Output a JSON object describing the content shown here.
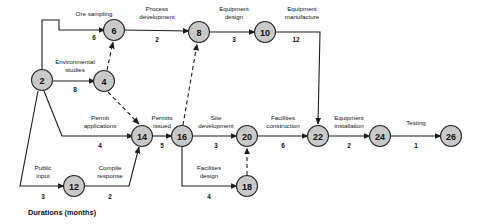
{
  "diagram": {
    "caption": "Durations (months)",
    "node_fill": "#c9c9c9",
    "node_stroke": "#2b2b2b",
    "line_color": "#1c1c1c",
    "nodes": [
      {
        "id": "n2",
        "label": "2",
        "cx": 42,
        "cy": 80
      },
      {
        "id": "n4",
        "label": "4",
        "cx": 104,
        "cy": 81
      },
      {
        "id": "n6",
        "label": "6",
        "cx": 114,
        "cy": 30
      },
      {
        "id": "n8",
        "label": "8",
        "cx": 199,
        "cy": 32
      },
      {
        "id": "n10",
        "label": "10",
        "cx": 265,
        "cy": 32
      },
      {
        "id": "n12",
        "label": "12",
        "cx": 74,
        "cy": 186
      },
      {
        "id": "n14",
        "label": "14",
        "cx": 142,
        "cy": 136
      },
      {
        "id": "n16",
        "label": "16",
        "cx": 182,
        "cy": 136
      },
      {
        "id": "n18",
        "label": "18",
        "cx": 247,
        "cy": 186
      },
      {
        "id": "n20",
        "label": "20",
        "cx": 247,
        "cy": 136
      },
      {
        "id": "n22",
        "label": "22",
        "cx": 318,
        "cy": 136
      },
      {
        "id": "n24",
        "label": "24",
        "cx": 380,
        "cy": 136
      },
      {
        "id": "n26",
        "label": "26",
        "cx": 451,
        "cy": 136
      }
    ],
    "edges": [
      {
        "id": "e-ore-sampling",
        "from": "2",
        "to": "6",
        "name": "Ore sampling",
        "duration": "6",
        "style": "solid",
        "name_x": 94,
        "name_y": 18,
        "dur_x": 94,
        "dur_y": 40
      },
      {
        "id": "e-process-development",
        "from": "6",
        "to": "8",
        "name": "Process\ndevelopment",
        "duration": "2",
        "style": "solid",
        "name_x": 157,
        "name_y": 12,
        "dur_x": 157,
        "dur_y": 42
      },
      {
        "id": "e-equipment-design",
        "from": "8",
        "to": "10",
        "name": "Equipment\ndesign",
        "duration": "3",
        "style": "solid",
        "name_x": 232,
        "name_y": 12,
        "dur_x": 232,
        "dur_y": 42
      },
      {
        "id": "e-equipment-manufacture",
        "from": "10",
        "to": "22",
        "name": "Equipment\nmanufacture",
        "duration": "12",
        "style": "solid",
        "name_x": 303,
        "name_y": 12,
        "dur_x": 303,
        "dur_y": 42
      },
      {
        "id": "e-environmental-studies",
        "from": "2",
        "to": "4",
        "name": "Environmental\nstudies",
        "duration": "8",
        "style": "solid",
        "name_x": 74,
        "name_y": 65,
        "dur_x": 74,
        "dur_y": 91
      },
      {
        "id": "e-permit-applications",
        "from": "2",
        "to": "14",
        "name": "Permit\napplications",
        "duration": "4",
        "style": "solid",
        "name_x": 100,
        "name_y": 119,
        "dur_x": 100,
        "dur_y": 148
      },
      {
        "id": "e-permits-issued",
        "from": "14",
        "to": "16",
        "name": "Permits\nissued",
        "duration": "5",
        "style": "solid",
        "name_x": 162,
        "name_y": 119,
        "dur_x": 162,
        "dur_y": 148
      },
      {
        "id": "e-site-development",
        "from": "16",
        "to": "20",
        "name": "Site\ndevelopment",
        "duration": "3",
        "style": "solid",
        "name_x": 215,
        "name_y": 119,
        "dur_x": 215,
        "dur_y": 148
      },
      {
        "id": "e-facilities-construction",
        "from": "20",
        "to": "22",
        "name": "Facilities\nconstruction",
        "duration": "6",
        "style": "solid",
        "name_x": 283,
        "name_y": 119,
        "dur_x": 283,
        "dur_y": 148
      },
      {
        "id": "e-equipment-installation",
        "from": "22",
        "to": "24",
        "name": "Equipment\ninstallation",
        "duration": "2",
        "style": "solid",
        "name_x": 349,
        "name_y": 119,
        "dur_x": 349,
        "dur_y": 148
      },
      {
        "id": "e-testing",
        "from": "24",
        "to": "26",
        "name": "Testing",
        "duration": "1",
        "style": "solid",
        "name_x": 416,
        "name_y": 124,
        "dur_x": 416,
        "dur_y": 148
      },
      {
        "id": "e-public-input",
        "from": "2",
        "to": "12",
        "name": "Public\ninput",
        "duration": "3",
        "style": "solid",
        "name_x": 44,
        "name_y": 170,
        "dur_x": 44,
        "dur_y": 198
      },
      {
        "id": "e-compile-response",
        "from": "12",
        "to": "14",
        "name": "Compile\nresponse",
        "duration": "2",
        "style": "solid",
        "name_x": 110,
        "name_y": 170,
        "dur_x": 110,
        "dur_y": 198
      },
      {
        "id": "e-facilities-design",
        "from": "16",
        "to": "18",
        "name": "Facilities\ndesign",
        "duration": "4",
        "style": "solid",
        "name_x": 208,
        "name_y": 170,
        "dur_x": 208,
        "dur_y": 198
      },
      {
        "id": "e-dummy-4-6",
        "from": "4",
        "to": "6",
        "name": "",
        "duration": "",
        "style": "dashed",
        "name_x": 0,
        "name_y": 0,
        "dur_x": 0,
        "dur_y": 0
      },
      {
        "id": "e-dummy-4-14",
        "from": "4",
        "to": "14",
        "name": "",
        "duration": "",
        "style": "dashed",
        "name_x": 0,
        "name_y": 0,
        "dur_x": 0,
        "dur_y": 0
      },
      {
        "id": "e-dummy-16-8",
        "from": "16",
        "to": "8",
        "name": "",
        "duration": "",
        "style": "dashed",
        "name_x": 0,
        "name_y": 0,
        "dur_x": 0,
        "dur_y": 0
      },
      {
        "id": "e-dummy-18-20",
        "from": "18",
        "to": "20",
        "name": "",
        "duration": "",
        "style": "dashed",
        "name_x": 0,
        "name_y": 0,
        "dur_x": 0,
        "dur_y": 0
      }
    ],
    "labels": {
      "ore_sampling": "Ore sampling",
      "process_development_l1": "Process",
      "process_development_l2": "development",
      "equipment_design_l1": "Equipment",
      "equipment_design_l2": "design",
      "equipment_manufacture_l1": "Equipment",
      "equipment_manufacture_l2": "manufacture",
      "environmental_studies_l1": "Environmental",
      "environmental_studies_l2": "studies",
      "permit_applications_l1": "Permit",
      "permit_applications_l2": "applications",
      "permits_issued_l1": "Permits",
      "permits_issued_l2": "issued",
      "site_development_l1": "Site",
      "site_development_l2": "development",
      "facilities_construction_l1": "Facilities",
      "facilities_construction_l2": "construction",
      "equipment_installation_l1": "Equipment",
      "equipment_installation_l2": "installation",
      "testing": "Testing",
      "public_input_l1": "Public",
      "public_input_l2": "input",
      "compile_response_l1": "Compile",
      "compile_response_l2": "response",
      "facilities_design_l1": "Facilities",
      "facilities_design_l2": "design"
    },
    "durations": {
      "ore_sampling": "6",
      "process_development": "2",
      "equipment_design": "3",
      "equipment_manufacture": "12",
      "environmental_studies": "8",
      "permit_applications": "4",
      "permits_issued": "5",
      "site_development": "3",
      "facilities_construction": "6",
      "equipment_installation": "2",
      "testing": "1",
      "public_input": "3",
      "compile_response": "2",
      "facilities_design": "4"
    },
    "node_labels": {
      "n2": "2",
      "n4": "4",
      "n6": "6",
      "n8": "8",
      "n10": "10",
      "n12": "12",
      "n14": "14",
      "n16": "16",
      "n18": "18",
      "n20": "20",
      "n22": "22",
      "n24": "24",
      "n26": "26"
    }
  }
}
